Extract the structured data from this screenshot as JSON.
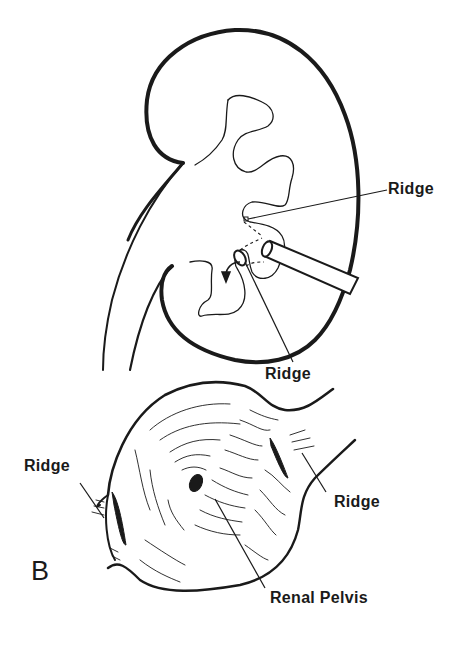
{
  "figure": {
    "panel_letter": "B",
    "top_view": {
      "subject": "kidney-cross-section-with-endoscope",
      "labels": {
        "ridge_upper": "Ridge",
        "ridge_lower": "Ridge"
      }
    },
    "bottom_view": {
      "subject": "renal-pelvis-interior",
      "labels": {
        "ridge_left": "Ridge",
        "ridge_right": "Ridge",
        "renal_pelvis": "Renal Pelvis"
      }
    },
    "colors": {
      "ink": "#1a1a1a",
      "background": "#ffffff"
    }
  }
}
